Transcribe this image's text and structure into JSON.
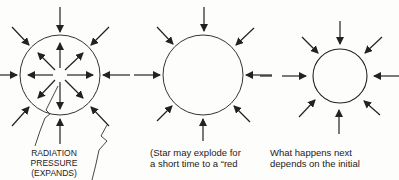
{
  "diagram": {
    "stages": [
      {
        "id": "stage-1",
        "description": "Star with radiation pressure pushing outward balanced by gravity pushing inward",
        "circle": {
          "cx": 60,
          "cy": 75,
          "r": 40
        },
        "inward_arrows": 8,
        "outward_arrows": 8,
        "label_lines": [
          "RADIATION",
          "PRESSURE",
          "(EXPANDS)"
        ]
      },
      {
        "id": "stage-2",
        "description": "Star with only gravity pushing inward",
        "circle": {
          "cx": 203,
          "cy": 75,
          "r": 40
        },
        "inward_arrows": 8,
        "outward_arrows": 0,
        "label_lines": [
          "(Star may explode for",
          "a short time to a “red"
        ]
      },
      {
        "id": "stage-3",
        "description": "Smaller contracted star with gravity pushing inward",
        "circle": {
          "cx": 340,
          "cy": 76,
          "r": 27
        },
        "inward_arrows": 8,
        "outward_arrows": 0,
        "label_lines": [
          "What happens next",
          "depends on the initial"
        ]
      }
    ],
    "colors": {
      "ink": "#222222",
      "background": "#fdfdfb"
    }
  }
}
